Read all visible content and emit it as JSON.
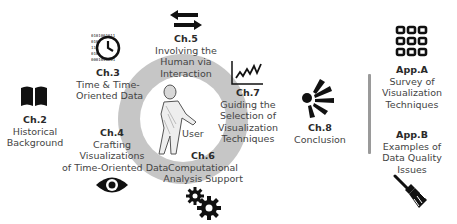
{
  "diagram": {
    "center": {
      "label": "User",
      "icon": "user-figure-icon"
    },
    "chapters": [
      {
        "id": "ch2",
        "number": "Ch.2",
        "lines": [
          "Historical",
          "Background"
        ],
        "icon": "book-icon"
      },
      {
        "id": "ch3",
        "number": "Ch.3",
        "lines": [
          "Time & Time-",
          "Oriented Data"
        ],
        "icon": "clock-binary-icon"
      },
      {
        "id": "ch4",
        "number": "Ch.4",
        "lines": [
          "Crafting",
          "Visualizations",
          "of Time-Oriented Data"
        ],
        "icon": "eye-icon"
      },
      {
        "id": "ch5",
        "number": "Ch.5",
        "lines": [
          "Involving the",
          "Human via",
          "Interaction"
        ],
        "icon": "arrows-left-right-icon"
      },
      {
        "id": "ch6",
        "number": "Ch.6",
        "lines": [
          "Computational",
          "Analysis Support"
        ],
        "icon": "gears-icon"
      },
      {
        "id": "ch7",
        "number": "Ch.7",
        "lines": [
          "Guiding the",
          "Selection of",
          "Visualization",
          "Techniques"
        ],
        "icon": "line-chart-icon"
      },
      {
        "id": "ch8",
        "number": "Ch.8",
        "lines": [
          "Conclusion"
        ],
        "icon": "burst-icon"
      }
    ],
    "appendices": [
      {
        "id": "appA",
        "number": "App.A",
        "lines": [
          "Survey of",
          "Visualization",
          "Techniques"
        ],
        "icon": "grid-icon"
      },
      {
        "id": "appB",
        "number": "App.B",
        "lines": [
          "Examples of",
          "Data Quality",
          "Issues"
        ],
        "icon": "broom-icon"
      }
    ],
    "colors": {
      "ring": "#c6c6c6",
      "icon": "#111111",
      "text": "#444444",
      "divider": "#9a9a9a"
    }
  }
}
